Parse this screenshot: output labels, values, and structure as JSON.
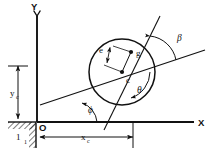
{
  "figure": {
    "type": "engineering-diagram",
    "background_color": "#ffffff",
    "line_color": "#111111"
  },
  "axes": {
    "x_label": "X",
    "y_label": "Y",
    "origin_label": "O"
  },
  "points": [
    {
      "id": "c",
      "label": "c",
      "role": "circle-center",
      "x": 122,
      "y": 72
    },
    {
      "id": "g",
      "label": "g",
      "role": "mass-center",
      "x": 131,
      "y": 52
    }
  ],
  "angles": [
    {
      "id": "beta",
      "label": "β",
      "position": "upper-right"
    },
    {
      "id": "theta",
      "label": "θ",
      "position": "lower-right-of-center"
    },
    {
      "id": "phi",
      "label": "ϕ",
      "position": "lower-left-of-center"
    }
  ],
  "dimensions": [
    {
      "id": "e",
      "label": "e",
      "orientation": "inclined",
      "description": "eccentricity between c and g"
    },
    {
      "id": "x_c",
      "label": "x",
      "subscript": "c",
      "orientation": "horizontal",
      "description": "horizontal distance from origin to circle center"
    },
    {
      "id": "y_c",
      "label": "y",
      "subscript": "c",
      "orientation": "vertical",
      "description": "vertical distance from ground to circle center"
    }
  ],
  "supports": [
    {
      "id": "ground-support",
      "label": "1",
      "hatching": "diagonal",
      "orientation": "horizontal"
    },
    {
      "id": "wall-support",
      "label": "1",
      "hatching": "diagonal",
      "orientation": "vertical"
    }
  ],
  "circle": {
    "center_x": 122,
    "center_y": 72,
    "radius": 33
  }
}
